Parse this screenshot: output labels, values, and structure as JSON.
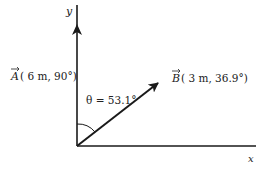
{
  "diagram": {
    "axes": {
      "x_label": "x",
      "y_label": "y"
    },
    "vectors": [
      {
        "name": "A",
        "label_symbol": "A",
        "label_params": "( 6 m, 90°)",
        "magnitude": "6 m",
        "angle": "90°"
      },
      {
        "name": "B",
        "label_symbol": "B",
        "label_params": "( 3 m, 36.9°)",
        "magnitude": "3 m",
        "angle": "36.9°"
      }
    ],
    "angle_annotation": {
      "text": "θ = 53.1°"
    },
    "colors": {
      "line": "#1a1a1a",
      "text": "#222222"
    }
  }
}
